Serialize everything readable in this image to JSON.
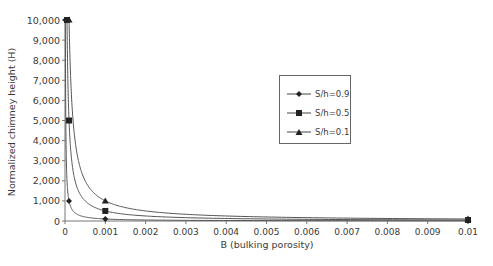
{
  "chart_data": {
    "type": "line",
    "title": "",
    "xlabel": "B (bulking porosity)",
    "ylabel": "Normalized chimney height (H)",
    "xlim": [
      0,
      0.01
    ],
    "ylim": [
      0,
      10000
    ],
    "x_ticks": [
      "0",
      "0.001",
      "0.002",
      "0.003",
      "0.004",
      "0.005",
      "0.006",
      "0.007",
      "0.008",
      "0.009",
      "0.01"
    ],
    "y_ticks": [
      "0",
      "1,000",
      "2,000",
      "3,000",
      "4,000",
      "5,000",
      "6,000",
      "7,000",
      "8,000",
      "9,000",
      "10,000"
    ],
    "grid": false,
    "legend_position": "upper-center-right",
    "series": [
      {
        "name": "S/h=0.9",
        "marker": "diamond",
        "x": [
          1e-05,
          0.0001,
          0.001,
          0.01
        ],
        "values": [
          10000,
          1000,
          100,
          10
        ]
      },
      {
        "name": "S/h=0.5",
        "marker": "square",
        "x": [
          5e-05,
          0.0001,
          0.001,
          0.01
        ],
        "values": [
          10000,
          5000,
          500,
          50
        ]
      },
      {
        "name": "S/h=0.1",
        "marker": "triangle",
        "x": [
          0.0001,
          0.001,
          0.01
        ],
        "values": [
          10000,
          1000,
          100
        ]
      }
    ]
  },
  "legend": {
    "items": [
      {
        "label": "S/h=0.9"
      },
      {
        "label": "S/h=0.5"
      },
      {
        "label": "S/h=0.1"
      }
    ]
  }
}
